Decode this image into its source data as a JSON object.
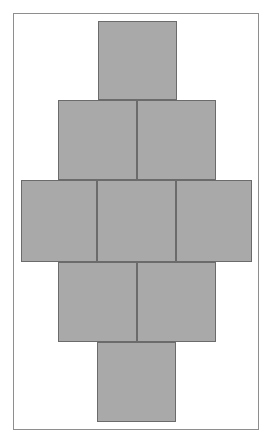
{
  "figure": {
    "canvas_width": 274,
    "canvas_height": 447,
    "background_color": "#ffffff"
  },
  "frame": {
    "name": "outer-border-rectangle",
    "x": 13,
    "y": 13,
    "width": 246,
    "height": 417,
    "stroke_color": "#8e8e8e",
    "stroke_width": 1,
    "fill_color": "#ffffff"
  },
  "pattern": {
    "name": "diamond-checkerboard-fill",
    "fill_color": "#a9a9a9",
    "background_color": "#ffffff",
    "cell_size_px": 5
  },
  "net": {
    "face_stroke_color": "#6b6b6b",
    "face_stroke_width": 1,
    "face_count": 9,
    "rows": [
      {
        "row_index": 0,
        "face_count": 1,
        "y": 21,
        "height": 79
      },
      {
        "row_index": 1,
        "face_count": 2,
        "y": 100,
        "height": 80
      },
      {
        "row_index": 2,
        "face_count": 3,
        "y": 180,
        "height": 82
      },
      {
        "row_index": 3,
        "face_count": 2,
        "y": 262,
        "height": 80
      },
      {
        "row_index": 4,
        "face_count": 1,
        "y": 342,
        "height": 80
      }
    ],
    "faces": [
      {
        "id": "face-top",
        "row": 0,
        "col": 0,
        "x": 98,
        "y": 21,
        "width": 79,
        "height": 79
      },
      {
        "id": "face-upper-left",
        "row": 1,
        "col": 0,
        "x": 58,
        "y": 100,
        "width": 79,
        "height": 80
      },
      {
        "id": "face-upper-right",
        "row": 1,
        "col": 1,
        "x": 137,
        "y": 100,
        "width": 79,
        "height": 80
      },
      {
        "id": "face-middle-left",
        "row": 2,
        "col": 0,
        "x": 21,
        "y": 180,
        "width": 76,
        "height": 82
      },
      {
        "id": "face-middle-center",
        "row": 2,
        "col": 1,
        "x": 97,
        "y": 180,
        "width": 79,
        "height": 82
      },
      {
        "id": "face-middle-right",
        "row": 2,
        "col": 2,
        "x": 176,
        "y": 180,
        "width": 76,
        "height": 82
      },
      {
        "id": "face-lower-left",
        "row": 3,
        "col": 0,
        "x": 58,
        "y": 262,
        "width": 79,
        "height": 80
      },
      {
        "id": "face-lower-right",
        "row": 3,
        "col": 1,
        "x": 137,
        "y": 262,
        "width": 79,
        "height": 80
      },
      {
        "id": "face-bottom",
        "row": 4,
        "col": 0,
        "x": 97,
        "y": 342,
        "width": 79,
        "height": 80
      }
    ]
  }
}
